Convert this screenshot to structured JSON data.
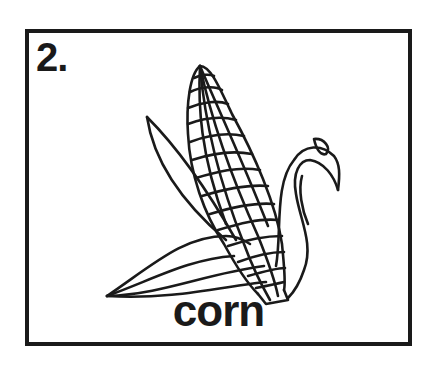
{
  "card": {
    "number": "2.",
    "word": "corn",
    "illustration": "corn-cob-icon"
  },
  "colors": {
    "ink": "#1a1a1a",
    "paper": "#ffffff"
  }
}
